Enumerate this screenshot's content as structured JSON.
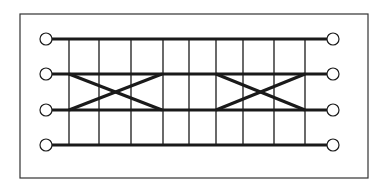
{
  "diagram": {
    "title": "",
    "stroke_color": "#1a1a1a",
    "background": "#ffffff",
    "frame": {
      "x": 20,
      "y": 14,
      "width": 348,
      "height": 164
    },
    "rails": [
      {
        "id": "rail-1",
        "y": 39
      },
      {
        "id": "rail-2",
        "y": 74
      },
      {
        "id": "rail-3",
        "y": 110
      },
      {
        "id": "rail-4",
        "y": 145
      }
    ],
    "rail_x_start": 52,
    "rail_x_end": 327,
    "terminal_radius": 6,
    "left_terminal_x": 46,
    "right_terminal_x": 333,
    "rungs_x": [
      69,
      99,
      131,
      163,
      189,
      216,
      243,
      274,
      305
    ],
    "crossovers": [
      {
        "id": "crossover-1",
        "x_start": 69,
        "x_end": 162,
        "from_rail": 2,
        "to_rail": 3
      },
      {
        "id": "crossover-2",
        "x_start": 216,
        "x_end": 305,
        "from_rail": 2,
        "to_rail": 3
      }
    ]
  }
}
